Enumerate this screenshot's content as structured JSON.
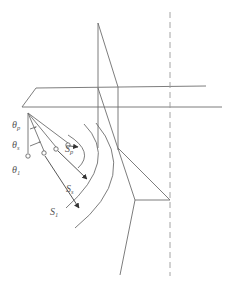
{
  "diagram": {
    "type": "geometric-ray-diagram",
    "colors": {
      "line": "#6e6e6e",
      "dashed": "#9a9a9a",
      "text": "#555555",
      "background": "#ffffff"
    },
    "angle_labels": [
      {
        "id": "theta_p",
        "base": "θ",
        "sub": "p"
      },
      {
        "id": "theta_s",
        "base": "θ",
        "sub": "s"
      },
      {
        "id": "theta_1",
        "base": "θ",
        "sub": "1"
      }
    ],
    "ray_labels": [
      {
        "id": "S_p",
        "base": "S",
        "sub": "p"
      },
      {
        "id": "S_s",
        "base": "S",
        "sub": "s"
      },
      {
        "id": "S_1",
        "base": "S",
        "sub": "1"
      }
    ]
  }
}
